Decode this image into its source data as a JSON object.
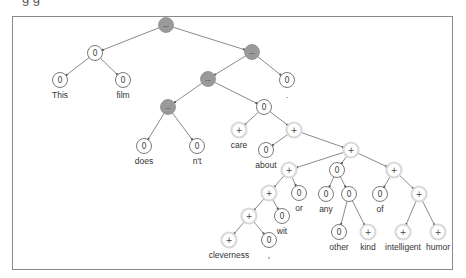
{
  "diagram": {
    "type": "sentiment-parse-tree",
    "top_cut_text": "g g",
    "legend_symbols": {
      "negative": "−",
      "neutral": "0",
      "positive": "+"
    },
    "colors": {
      "negative_fill": "#9a9a9a",
      "neutral_fill": "#ffffff",
      "positive_ring": "#d9d9d9",
      "edge": "#7d7d7d"
    },
    "nodes": [
      {
        "id": "n0",
        "label": "−",
        "polarity": "negative",
        "word": ""
      },
      {
        "id": "n1",
        "label": "0",
        "polarity": "neutral",
        "word": ""
      },
      {
        "id": "n2",
        "label": "0",
        "polarity": "neutral",
        "word": "This"
      },
      {
        "id": "n3",
        "label": "0",
        "polarity": "neutral",
        "word": "film"
      },
      {
        "id": "n4",
        "label": "−",
        "polarity": "negative",
        "word": ""
      },
      {
        "id": "n5",
        "label": "0",
        "polarity": "neutral",
        "word": "."
      },
      {
        "id": "n6",
        "label": "−",
        "polarity": "negative",
        "word": ""
      },
      {
        "id": "n7",
        "label": "−",
        "polarity": "negative",
        "word": ""
      },
      {
        "id": "n8",
        "label": "0",
        "polarity": "neutral",
        "word": "does"
      },
      {
        "id": "n9",
        "label": "0",
        "polarity": "neutral",
        "word": "n't"
      },
      {
        "id": "n10",
        "label": "0",
        "polarity": "neutral",
        "word": ""
      },
      {
        "id": "n11",
        "label": "+",
        "polarity": "positive",
        "word": "care"
      },
      {
        "id": "n12",
        "label": "+",
        "polarity": "positive",
        "word": ""
      },
      {
        "id": "n13",
        "label": "0",
        "polarity": "neutral",
        "word": "about"
      },
      {
        "id": "n14",
        "label": "+",
        "polarity": "positive",
        "word": ""
      },
      {
        "id": "n15",
        "label": "+",
        "polarity": "positive",
        "word": ""
      },
      {
        "id": "n16",
        "label": "+",
        "polarity": "positive",
        "word": ""
      },
      {
        "id": "n17",
        "label": "0",
        "polarity": "neutral",
        "word": "or"
      },
      {
        "id": "n18",
        "label": "+",
        "polarity": "positive",
        "word": ""
      },
      {
        "id": "n19",
        "label": "0",
        "polarity": "neutral",
        "word": "wit"
      },
      {
        "id": "n20",
        "label": "+",
        "polarity": "positive",
        "word": "cleverness"
      },
      {
        "id": "n21",
        "label": "0",
        "polarity": "neutral",
        "word": ","
      },
      {
        "id": "n22",
        "label": "0",
        "polarity": "neutral",
        "word": ""
      },
      {
        "id": "n23",
        "label": "0",
        "polarity": "neutral",
        "word": "any"
      },
      {
        "id": "n24",
        "label": "0",
        "polarity": "neutral",
        "word": ""
      },
      {
        "id": "n25",
        "label": "0",
        "polarity": "neutral",
        "word": "other"
      },
      {
        "id": "n26",
        "label": "+",
        "polarity": "positive",
        "word": "kind"
      },
      {
        "id": "n27",
        "label": "+",
        "polarity": "positive",
        "word": ""
      },
      {
        "id": "n28",
        "label": "0",
        "polarity": "neutral",
        "word": "of"
      },
      {
        "id": "n29",
        "label": "+",
        "polarity": "positive",
        "word": ""
      },
      {
        "id": "n30",
        "label": "+",
        "polarity": "positive",
        "word": "intelligent"
      },
      {
        "id": "n31",
        "label": "+",
        "polarity": "positive",
        "word": "humor"
      }
    ],
    "edges": [
      [
        "n0",
        "n1"
      ],
      [
        "n0",
        "n4"
      ],
      [
        "n1",
        "n2"
      ],
      [
        "n1",
        "n3"
      ],
      [
        "n4",
        "n6"
      ],
      [
        "n4",
        "n5"
      ],
      [
        "n6",
        "n7"
      ],
      [
        "n6",
        "n10"
      ],
      [
        "n7",
        "n8"
      ],
      [
        "n7",
        "n9"
      ],
      [
        "n10",
        "n11"
      ],
      [
        "n10",
        "n12"
      ],
      [
        "n12",
        "n13"
      ],
      [
        "n12",
        "n14"
      ],
      [
        "n14",
        "n15"
      ],
      [
        "n14",
        "n22"
      ],
      [
        "n14",
        "n27"
      ],
      [
        "n15",
        "n16"
      ],
      [
        "n15",
        "n17"
      ],
      [
        "n16",
        "n18"
      ],
      [
        "n16",
        "n19"
      ],
      [
        "n18",
        "n20"
      ],
      [
        "n18",
        "n21"
      ],
      [
        "n22",
        "n23"
      ],
      [
        "n22",
        "n24"
      ],
      [
        "n24",
        "n25"
      ],
      [
        "n24",
        "n26"
      ],
      [
        "n27",
        "n28"
      ],
      [
        "n27",
        "n29"
      ],
      [
        "n29",
        "n30"
      ],
      [
        "n29",
        "n31"
      ]
    ]
  }
}
